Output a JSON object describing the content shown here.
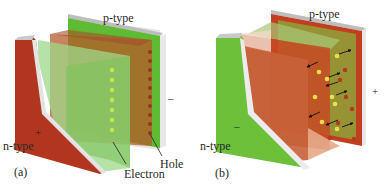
{
  "figure": {
    "panels": [
      {
        "id": "a",
        "caption": "(a)",
        "labels": {
          "p_type": "p-type",
          "n_type": "n-type",
          "electron": "Electron",
          "hole": "Hole"
        },
        "signs": {
          "n_side": "+",
          "p_side": "–"
        },
        "colors": {
          "n_region": "#b2361f",
          "p_region": "#5fb832",
          "electron": "#c8e84a",
          "hole": "#9e3320"
        }
      },
      {
        "id": "b",
        "caption": "(b)",
        "labels": {
          "p_type": "p-type",
          "n_type": "n-type"
        },
        "signs": {
          "n_side": "–",
          "p_side": "+"
        },
        "colors": {
          "n_region": "#6cc03a",
          "p_region": "#c0401f",
          "electron": "#e6e04a",
          "hole": "#b03a1c"
        }
      }
    ]
  }
}
